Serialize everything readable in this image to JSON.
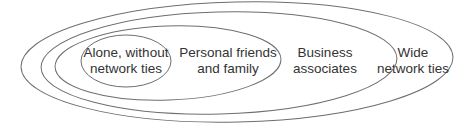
{
  "diagram": {
    "type": "nested-ellipses",
    "stroke_color": "#6e6e6e",
    "text_color": "#333333",
    "rings": [
      {
        "id": "wide",
        "lines": [
          "Wide",
          "network ties"
        ]
      },
      {
        "id": "business",
        "lines": [
          "Business",
          "associates"
        ]
      },
      {
        "id": "personal",
        "lines": [
          "Personal friends",
          "and family"
        ]
      },
      {
        "id": "alone",
        "lines": [
          "Alone, without",
          "network ties"
        ]
      }
    ]
  }
}
